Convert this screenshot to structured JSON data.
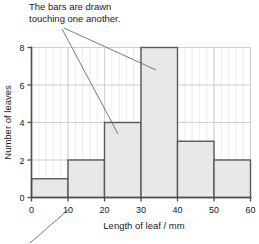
{
  "annotations": {
    "bars_note": "The bars are drawn\ntouching one another.",
    "leader_lines": [
      {
        "name": "note-leader-to-20-30-bar",
        "x1": 62,
        "y1": 29,
        "x2": 118,
        "y2": 134
      },
      {
        "name": "note-leader-to-30-40-bar",
        "x1": 64,
        "y1": 28,
        "x2": 156,
        "y2": 70
      },
      {
        "name": "x-axis-leader-to-10-tick",
        "x1": 30,
        "y1": 243,
        "x2": 68,
        "y2": 210
      }
    ]
  },
  "chart_data": {
    "type": "bar",
    "title": "",
    "xlabel": "Length of leaf / mm",
    "ylabel": "Number of leaves",
    "categories": [
      "0-10",
      "10-20",
      "20-30",
      "30-40",
      "40-50",
      "50-60"
    ],
    "bin_edges": [
      0,
      10,
      20,
      30,
      40,
      50,
      60
    ],
    "values": [
      1,
      2,
      4,
      8,
      3,
      2
    ],
    "xlim": [
      0,
      60
    ],
    "ylim": [
      0,
      8
    ],
    "xticks": [
      0,
      10,
      20,
      30,
      40,
      50,
      60
    ],
    "xtick_labels": [
      "0",
      "10",
      "20",
      "30",
      "40",
      "50",
      "60"
    ],
    "yticks": [
      0,
      2,
      4,
      6,
      8
    ],
    "ytick_labels": [
      "0",
      "2",
      "4",
      "6",
      "8"
    ],
    "grid": true,
    "legend": null,
    "bar_fill_color": "#e8e8e8",
    "bar_edge_color": "#595959",
    "grid_color": "#cfcfcf",
    "axis_color": "#4d4d4d"
  }
}
